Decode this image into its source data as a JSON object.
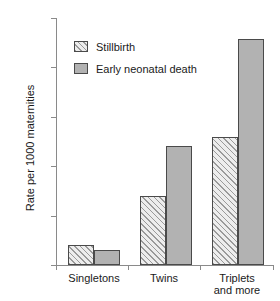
{
  "chart_data": {
    "type": "bar",
    "title": "",
    "xlabel": "",
    "ylabel": "Rate per 1000 maternities",
    "ylim": [
      0,
      50
    ],
    "yticks": [
      0,
      10,
      20,
      30,
      40,
      50
    ],
    "ytick_labels": [
      "0",
      "10",
      "20",
      "30",
      "40",
      "50"
    ],
    "grid": false,
    "legend_position": "upper left",
    "categories": [
      "Singletons",
      "Twins",
      "Triplets and more"
    ],
    "category_lines": [
      [
        "Singletons"
      ],
      [
        "Twins"
      ],
      [
        "Triplets",
        "and more"
      ]
    ],
    "series": [
      {
        "name": "Stillbirth",
        "values": [
          4,
          14,
          26
        ],
        "fill": "hatched",
        "color": "#ededed"
      },
      {
        "name": "Early neonatal death",
        "values": [
          3,
          24,
          45.8
        ],
        "fill": "solid",
        "color": "#b2b2b2"
      }
    ],
    "axis_color": "#8a8a8a",
    "bar_edge_color": "#4a4a4a"
  },
  "legend": {
    "items": [
      {
        "label": "Stillbirth",
        "swatch": "hatched-swatch-icon"
      },
      {
        "label": "Early neonatal death",
        "swatch": "solid-gray-swatch-icon"
      }
    ]
  },
  "axes": {
    "y_title": "Rate per 1000 maternities",
    "y_labels": [
      "50",
      "40",
      "30",
      "20",
      "10",
      "0"
    ],
    "x_labels": [
      {
        "line1": "Singletons",
        "line2": ""
      },
      {
        "line1": "Twins",
        "line2": ""
      },
      {
        "line1": "Triplets",
        "line2": "and more"
      }
    ]
  }
}
